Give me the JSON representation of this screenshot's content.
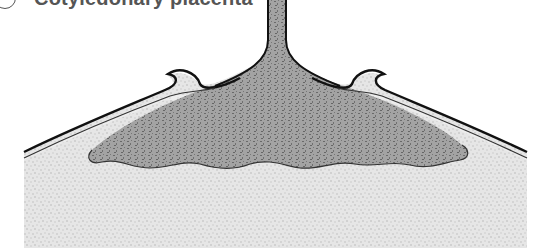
{
  "figure": {
    "heading_letter": "c",
    "heading_text": "Cotyledonary placenta"
  },
  "colors": {
    "background": "#ffffff",
    "maternal_tissue": "#e4e4e4",
    "fetal_tissue": "#9a9a9a",
    "fetal_speckle": "#6e6e6e",
    "outline": "#111111",
    "membrane_inner": "#f2f2f2"
  }
}
